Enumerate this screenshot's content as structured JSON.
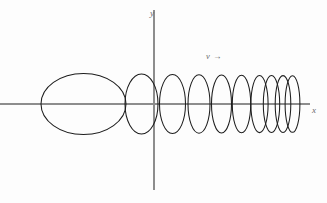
{
  "figure": {
    "kind": "vector-diagram",
    "width": 327,
    "height": 203,
    "background_color": "#fdfdfd",
    "curve_color": "#1d1d1d",
    "axis_color": "#8d8d8d",
    "label_color": "#6a6a6a"
  },
  "labels": {
    "y_axis": "y",
    "x_axis": "x",
    "drift": "v →"
  },
  "chart_data": {
    "type": "scatter",
    "xlabel": "x",
    "ylabel": "y",
    "grid": false,
    "legend": "none",
    "axes": {
      "origin_px": [
        154,
        104
      ],
      "x_axis_px": {
        "x1": 0,
        "y1": 104,
        "x2": 310,
        "y2": 104
      },
      "y_axis_px": {
        "x1": 154,
        "y1": 10,
        "x2": 154,
        "y2": 190
      }
    },
    "annotations": [
      {
        "text": "v →",
        "x_px": 210,
        "y_px": 57,
        "meaning": "drift-velocity-direction"
      },
      {
        "text": "y",
        "x_px": 154,
        "y_px": 13,
        "meaning": "y-axis-label"
      },
      {
        "text": "x",
        "x_px": 315,
        "y_px": 110,
        "meaning": "x-axis-label"
      }
    ],
    "ellipses": [
      {
        "index": 1,
        "cx": 83.5,
        "cy": 104,
        "rx": 42.5,
        "ry": 30.5
      },
      {
        "index": 2,
        "cx": 141.5,
        "cy": 104,
        "rx": 16.5,
        "ry": 30.0
      },
      {
        "index": 3,
        "cx": 172.5,
        "cy": 104,
        "rx": 13.0,
        "ry": 29.5
      },
      {
        "index": 4,
        "cx": 199.0,
        "cy": 104,
        "rx": 11.0,
        "ry": 29.2
      },
      {
        "index": 5,
        "cx": 221.5,
        "cy": 104,
        "rx": 10.0,
        "ry": 29.0
      },
      {
        "index": 6,
        "cx": 241.5,
        "cy": 104,
        "rx": 9.2,
        "ry": 28.8
      },
      {
        "index": 7,
        "cx": 259.5,
        "cy": 104,
        "rx": 8.6,
        "ry": 28.6
      },
      {
        "index": 8,
        "cx": 271.5,
        "cy": 104,
        "rx": 8.2,
        "ry": 28.5
      },
      {
        "index": 9,
        "cx": 283.0,
        "cy": 104,
        "rx": 7.8,
        "ry": 28.4
      },
      {
        "index": 10,
        "cx": 292.5,
        "cy": 104,
        "rx": 7.4,
        "ry": 28.3
      }
    ],
    "ellipse_count": 10
  }
}
